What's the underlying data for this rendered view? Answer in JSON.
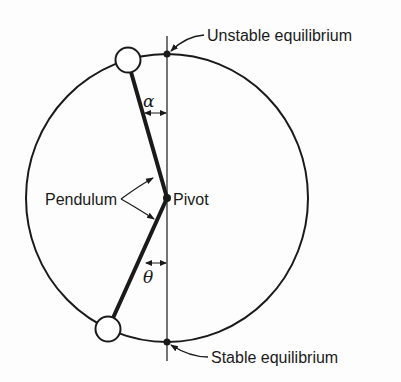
{
  "diagram": {
    "labels": {
      "unstable": "Unstable equilibrium",
      "stable": "Stable equilibrium",
      "pendulum": "Pendulum",
      "pivot": "Pivot",
      "alpha": "α",
      "theta": "θ"
    },
    "colors": {
      "stroke": "#1a1a1a",
      "background": "#fdfdfd",
      "bob_fill": "#ffffff"
    },
    "geometry": {
      "circle_center": [
        167,
        198
      ],
      "circle_radius": [
        141,
        144
      ],
      "pivot": [
        167,
        198
      ],
      "top_bob": [
        128,
        60
      ],
      "bottom_bob": [
        108,
        329
      ],
      "bob_radius": 12
    }
  }
}
